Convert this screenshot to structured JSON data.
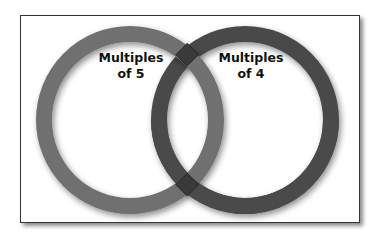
{
  "diagram": {
    "type": "venn",
    "sets": [
      {
        "id": "left",
        "label_line1": "Multiples",
        "label_line2": "of 5",
        "color": "#6e6e6e"
      },
      {
        "id": "right",
        "label_line1": "Multiples",
        "label_line2": "of 4",
        "color": "#4a4a4a"
      }
    ],
    "overlap_color": "#3a3a3a"
  }
}
